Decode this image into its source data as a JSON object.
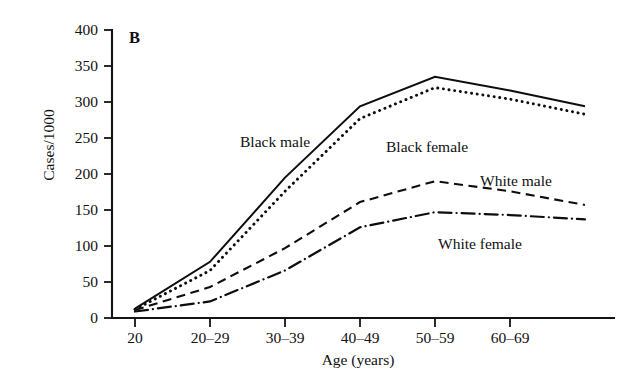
{
  "figure": {
    "panel_letter": "B",
    "background_color": "#ffffff",
    "ink_color": "#111111"
  },
  "chart_data": {
    "type": "line",
    "title": "",
    "panel": "B",
    "xlabel": "Age (years)",
    "ylabel": "Cases/1000",
    "categories": [
      "20",
      "20–29",
      "30–39",
      "40–49",
      "50–59",
      "60–69",
      ""
    ],
    "x_tick_labels": [
      "20",
      "20–29",
      "30–39",
      "40–49",
      "50–59",
      "60–69"
    ],
    "y_tick_labels": [
      "0",
      "50",
      "100",
      "150",
      "200",
      "250",
      "300",
      "350",
      "400"
    ],
    "y_ticks": [
      0,
      50,
      100,
      150,
      200,
      250,
      300,
      350,
      400
    ],
    "ylim": [
      0,
      400
    ],
    "grid": false,
    "legend": "inline-annotations",
    "series": [
      {
        "name": "Black male",
        "line_style": "solid",
        "color": "#0d0d0d",
        "values": [
          13,
          78,
          195,
          294,
          335,
          316,
          294
        ],
        "label_x": 240,
        "label_y": 133
      },
      {
        "name": "Black female",
        "line_style": "dotted",
        "color": "#0d0d0d",
        "values": [
          12,
          66,
          176,
          277,
          320,
          304,
          283
        ],
        "label_x": 386,
        "label_y": 138
      },
      {
        "name": "White male",
        "line_style": "dashed",
        "color": "#0d0d0d",
        "values": [
          11,
          43,
          97,
          161,
          190,
          176,
          157
        ],
        "label_x": 480,
        "label_y": 172
      },
      {
        "name": "White female",
        "line_style": "dash-dot",
        "color": "#0d0d0d",
        "values": [
          9,
          23,
          66,
          126,
          147,
          143,
          137
        ],
        "label_x": 438,
        "label_y": 235
      }
    ]
  }
}
